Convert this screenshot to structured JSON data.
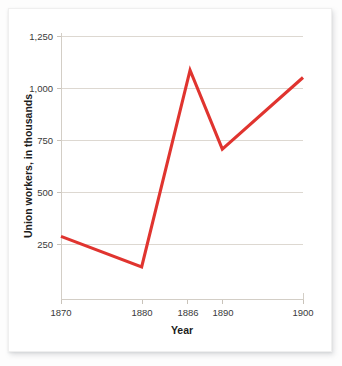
{
  "chart_data": {
    "type": "line",
    "title": "",
    "subtitle": "",
    "xlabel": "Year",
    "ylabel": "Union workers, in thousands",
    "x": [
      1870,
      1880,
      1886,
      1890,
      1900
    ],
    "xtick_labels": [
      "1870",
      "1880",
      "1886",
      "1890",
      "1900"
    ],
    "ytick_labels": [
      "250",
      "500",
      "750",
      "1,000",
      "1,250"
    ],
    "ytick_values": [
      250,
      500,
      750,
      1000,
      1250
    ],
    "ylim": [
      0,
      1250
    ],
    "xlim": [
      1870,
      1900
    ],
    "grid": "horizontal",
    "legend": "none",
    "series": [
      {
        "name": "Union workers",
        "color": "#e0342f",
        "values": [
          300,
          155,
          1090,
          715,
          1055
        ]
      }
    ],
    "colors": {
      "line": "#e0342f",
      "gridline": "#ddd8d1",
      "axis": "#d3cec6",
      "text": "#1c1c1c",
      "tick_text": "#3a3a3a",
      "plot_background": "#ffffff",
      "page_background": "#fdfdfd"
    },
    "points": [
      {
        "year": "1870",
        "value": 300
      },
      {
        "year": "1880",
        "value": 155
      },
      {
        "year": "1886",
        "value": 1090
      },
      {
        "year": "1890",
        "value": 715
      },
      {
        "year": "1900",
        "value": 1055
      }
    ]
  }
}
